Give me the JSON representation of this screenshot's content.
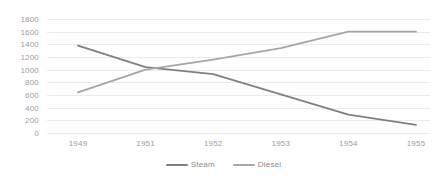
{
  "chart_data": {
    "type": "line",
    "title": "",
    "xlabel": "",
    "ylabel": "",
    "categories": [
      "1949",
      "1951",
      "1952",
      "1953",
      "1954",
      "1955"
    ],
    "ylim": [
      0,
      1800
    ],
    "ytick_step": 200,
    "yticks": [
      "1800",
      "1600",
      "1400",
      "1200",
      "1000",
      "800",
      "600",
      "400",
      "200",
      "0"
    ],
    "grid": true,
    "legend_position": "bottom-center",
    "series": [
      {
        "name": "Steam",
        "color": "#808080",
        "values": [
          1380,
          1040,
          930,
          610,
          290,
          130
        ]
      },
      {
        "name": "Diesel",
        "color": "#a6a6a6",
        "values": [
          640,
          1000,
          1160,
          1340,
          1600,
          1600
        ]
      }
    ]
  },
  "legend": {
    "items": [
      {
        "label": "Steam",
        "color": "#808080"
      },
      {
        "label": "Diesel",
        "color": "#a6a6a6"
      }
    ]
  },
  "colors": {
    "background": "#ffffff",
    "gridline": "#ebebeb",
    "tick_text": "#9c9c9c",
    "legend_text": "#8a8a8a"
  }
}
